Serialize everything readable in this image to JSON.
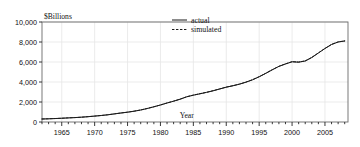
{
  "chart_data": {
    "type": "line",
    "title": "",
    "xlabel": "Year",
    "ylabel": "$Billions",
    "ylabel_position": "top-left",
    "xlim": [
      1962,
      2008.5
    ],
    "ylim": [
      0,
      10000
    ],
    "grid": true,
    "grid_color": "#e6e6e6",
    "legend_position": "top-center",
    "y_ticks": [
      0,
      2000,
      4000,
      6000,
      8000,
      10000
    ],
    "y_tick_labels": [
      "0",
      "2,000",
      "4,000",
      "6,000",
      "8,000",
      "10,000"
    ],
    "x_ticks": [
      1965,
      1970,
      1975,
      1980,
      1985,
      1990,
      1995,
      2000,
      2005
    ],
    "x_tick_labels": [
      "1965",
      "1970",
      "1975",
      "1980",
      "1985",
      "1990",
      "1995",
      "2000",
      "2005"
    ],
    "x_minor_tick_interval": 1,
    "x": [
      1962,
      1963,
      1964,
      1965,
      1966,
      1967,
      1968,
      1969,
      1970,
      1971,
      1972,
      1973,
      1974,
      1975,
      1976,
      1977,
      1978,
      1979,
      1980,
      1981,
      1982,
      1983,
      1984,
      1985,
      1986,
      1987,
      1988,
      1989,
      1990,
      1991,
      1992,
      1993,
      1994,
      1995,
      1996,
      1997,
      1998,
      1999,
      2000,
      2001,
      2002,
      2003,
      2004,
      2005,
      2006,
      2007,
      2008
    ],
    "series": [
      {
        "name": "actual",
        "style": "solid",
        "color": "#1a1a1a",
        "values": [
          300,
          320,
          345,
          375,
          410,
          440,
          480,
          530,
          590,
          650,
          720,
          810,
          900,
          980,
          1080,
          1200,
          1350,
          1520,
          1700,
          1900,
          2080,
          2280,
          2520,
          2680,
          2820,
          2960,
          3120,
          3300,
          3480,
          3620,
          3780,
          3980,
          4220,
          4520,
          4860,
          5220,
          5560,
          5800,
          6020,
          5980,
          6100,
          6450,
          6900,
          7350,
          7750,
          8000,
          8100
        ]
      },
      {
        "name": "simulated",
        "style": "dashed",
        "color": "#1a1a1a",
        "values": [
          300,
          322,
          347,
          377,
          412,
          443,
          483,
          533,
          592,
          653,
          723,
          813,
          903,
          983,
          1083,
          1203,
          1353,
          1523,
          1703,
          1903,
          2085,
          2290,
          2530,
          2690,
          2830,
          2970,
          3130,
          3310,
          3490,
          3630,
          3790,
          3995,
          4235,
          4535,
          4875,
          5235,
          5570,
          5815,
          6035,
          5995,
          6110,
          6460,
          6910,
          7360,
          7760,
          8010,
          8110
        ]
      }
    ]
  },
  "legend": {
    "items": [
      {
        "label": "actual",
        "style": "solid"
      },
      {
        "label": "simulated",
        "style": "dashed"
      }
    ]
  }
}
